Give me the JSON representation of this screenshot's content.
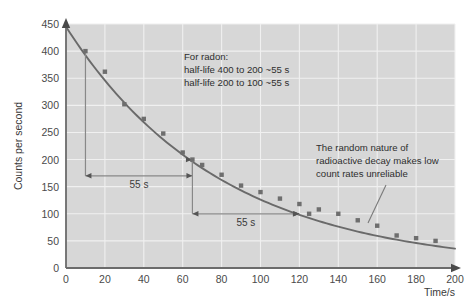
{
  "chart_data": {
    "type": "scatter",
    "title": "",
    "xlabel": "Time/s",
    "ylabel": "Counts per second",
    "xlim": [
      0,
      200
    ],
    "ylim": [
      0,
      450
    ],
    "xticks": [
      0,
      20,
      40,
      60,
      80,
      100,
      120,
      140,
      160,
      180,
      200
    ],
    "xticklabels": [
      "0",
      "20",
      "40",
      "60",
      "80",
      "100",
      "120",
      "140",
      "160",
      "180",
      "200"
    ],
    "yticks": [
      0,
      50,
      100,
      150,
      200,
      250,
      300,
      350,
      400,
      450
    ],
    "yticklabels": [
      "0",
      "50",
      "100",
      "150",
      "200",
      "250",
      "300",
      "350",
      "400",
      "450"
    ],
    "grid": true,
    "legend": "none",
    "series": [
      {
        "name": "Measured count rate",
        "marker": "square",
        "color": "#6e6e6e",
        "points": [
          {
            "x": 0,
            "y": 445
          },
          {
            "x": 10,
            "y": 400
          },
          {
            "x": 20,
            "y": 362
          },
          {
            "x": 30,
            "y": 302
          },
          {
            "x": 40,
            "y": 275
          },
          {
            "x": 50,
            "y": 248
          },
          {
            "x": 60,
            "y": 213
          },
          {
            "x": 65,
            "y": 200
          },
          {
            "x": 70,
            "y": 190
          },
          {
            "x": 80,
            "y": 172
          },
          {
            "x": 90,
            "y": 152
          },
          {
            "x": 100,
            "y": 140
          },
          {
            "x": 110,
            "y": 128
          },
          {
            "x": 120,
            "y": 118
          },
          {
            "x": 125,
            "y": 100
          },
          {
            "x": 130,
            "y": 108
          },
          {
            "x": 140,
            "y": 100
          },
          {
            "x": 150,
            "y": 88
          },
          {
            "x": 160,
            "y": 78
          },
          {
            "x": 170,
            "y": 60
          },
          {
            "x": 180,
            "y": 55
          },
          {
            "x": 190,
            "y": 50
          }
        ]
      }
    ],
    "fit_curve": {
      "name": "Exponential decay best fit",
      "color": "#6a6a6a",
      "model": "exponential",
      "initial_value": 445,
      "half_life": 55
    },
    "annotations": [
      {
        "name": "radon-half-life-note",
        "lines": [
          "For radon:",
          "half-life 400 to 200 ~55 s",
          "half-life 200 to 100 ~55 s"
        ]
      },
      {
        "name": "random-decay-note",
        "lines": [
          "The random nature of",
          "radioactive decay makes low",
          "count rates unreliable"
        ]
      }
    ],
    "interval_markers": [
      {
        "name": "first-half-life",
        "label": "55 s",
        "from_x": 10,
        "to_x": 65,
        "from_y": 400,
        "to_y": 200,
        "level_y": 170
      },
      {
        "name": "second-half-life",
        "label": "55 s",
        "from_x": 65,
        "to_x": 120,
        "from_y": 200,
        "to_y": 100,
        "level_y": 100
      }
    ]
  },
  "colors": {
    "plot_background": "#d7d7d7",
    "page_background": "#ffffff",
    "gridline": "#f0f0f0",
    "axis": "#6b6b6b",
    "marker": "#6e6e6e",
    "curve": "#6a6a6a",
    "text": "#2e2e2e"
  }
}
